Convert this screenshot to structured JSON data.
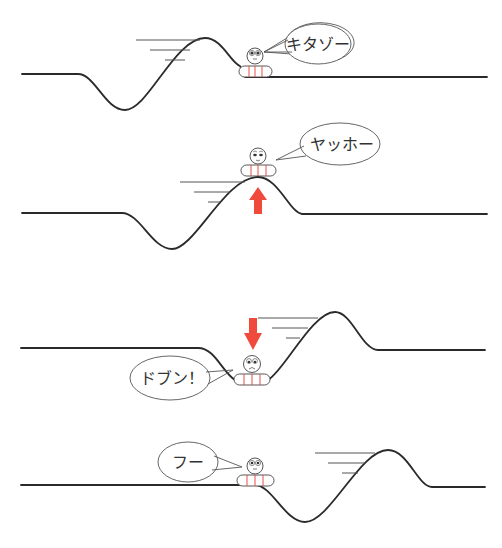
{
  "diagram": {
    "type": "sequence-illustration",
    "colors": {
      "line": "#2a2a2a",
      "arrow": "#f04a3c",
      "stripe": "#e8504a",
      "background": "#ffffff"
    },
    "panels": [
      {
        "id": 1,
        "speech": "キタゾー",
        "phase": "wave approaching",
        "arrow": null
      },
      {
        "id": 2,
        "speech": "ヤッホー",
        "phase": "lifted on crest",
        "arrow": "up"
      },
      {
        "id": 3,
        "speech": "ドブン！",
        "phase": "dropped into trough",
        "arrow": "down"
      },
      {
        "id": 4,
        "speech": "フー",
        "phase": "wave passed",
        "arrow": null
      }
    ]
  }
}
